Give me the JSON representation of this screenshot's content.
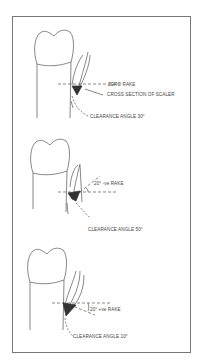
{
  "figure": {
    "panels": [
      {
        "id": "zero-rake",
        "rake_label": "ZERO RAKE",
        "section_label": "CROSS SECTION OF SCALER",
        "clearance_label": "CLEARANCE ANGLE 30°"
      },
      {
        "id": "negative-rake",
        "rake_label": "20° -ve RAKE",
        "clearance_label": "CLEARANCE ANGLE 50°"
      },
      {
        "id": "positive-rake",
        "rake_label": "20° +ve RAKE",
        "clearance_label": "CLEARANCE ANGLE 10°"
      }
    ]
  }
}
